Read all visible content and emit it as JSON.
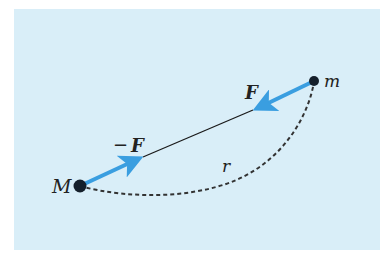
{
  "diagram": {
    "background_color": "#d9eef8",
    "arrow_color": "#3a9ee0",
    "line_color": "#1a1a1a",
    "bodies": [
      {
        "label": "M",
        "x": 80,
        "y": 186
      },
      {
        "label": "m",
        "x": 314,
        "y": 81
      }
    ],
    "forces": [
      {
        "label": "F",
        "from": "m",
        "direction": "toward M"
      },
      {
        "label": "−F",
        "from": "M",
        "direction": "toward m"
      }
    ],
    "distance": {
      "label": "r",
      "style": "dashed curve"
    }
  },
  "labels": {
    "big_mass": "M",
    "small_mass": "m",
    "force_on_m": "F",
    "force_on_M_sign": "−",
    "force_on_M": "F",
    "distance": "r"
  }
}
